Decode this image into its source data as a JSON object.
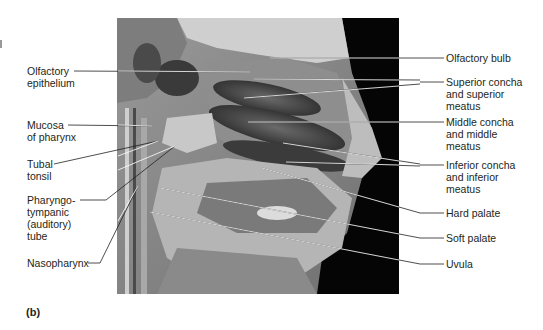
{
  "figure": {
    "panel_label": "(b)"
  },
  "labels_left": [
    {
      "id": "olfactory-epithelium",
      "lines": [
        "Olfactory",
        "epithelium"
      ]
    },
    {
      "id": "mucosa-of-pharynx",
      "lines": [
        "Mucosa",
        "of pharynx"
      ]
    },
    {
      "id": "tubal-tonsil",
      "lines": [
        "Tubal",
        "tonsil"
      ]
    },
    {
      "id": "pharyngotympanic-tube",
      "lines": [
        "Pharyngo-",
        "tympanic",
        "(auditory)",
        "tube"
      ]
    },
    {
      "id": "nasopharynx",
      "lines": [
        "Nasopharynx"
      ]
    }
  ],
  "labels_right": [
    {
      "id": "olfactory-bulb",
      "lines": [
        "Olfactory bulb"
      ]
    },
    {
      "id": "superior-concha",
      "lines": [
        "Superior concha",
        "and superior",
        "meatus"
      ]
    },
    {
      "id": "middle-concha",
      "lines": [
        "Middle concha",
        "and middle",
        "meatus"
      ]
    },
    {
      "id": "inferior-concha",
      "lines": [
        "Inferior concha",
        "and inferior",
        "meatus"
      ]
    },
    {
      "id": "hard-palate",
      "lines": [
        "Hard palate"
      ]
    },
    {
      "id": "soft-palate",
      "lines": [
        "Soft palate"
      ]
    },
    {
      "id": "uvula",
      "lines": [
        "Uvula"
      ]
    }
  ]
}
